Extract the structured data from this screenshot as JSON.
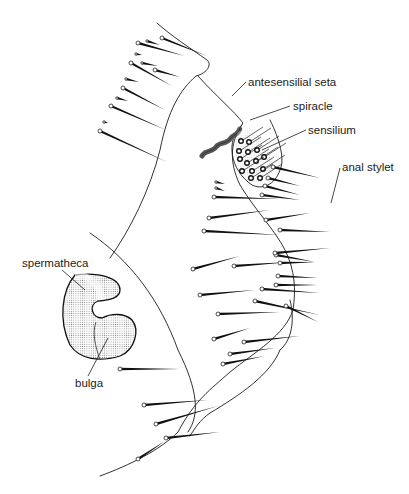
{
  "figure": {
    "labels": {
      "antesensilial_seta": "antesensilial seta",
      "spiracle": "spiracle",
      "sensilium": "sensilium",
      "anal_stylet": "anal stylet",
      "spermatheca": "spermatheca",
      "bulga": "bulga"
    },
    "colors": {
      "ink": "#1a1a1a",
      "stipple": "#bdbdbd",
      "background": "#ffffff"
    },
    "setae": [
      [
        162,
        38,
        207,
        56
      ],
      [
        138,
        43,
        185,
        56
      ],
      [
        147,
        41,
        160,
        45
      ],
      [
        136,
        54,
        142,
        55
      ],
      [
        131,
        63,
        172,
        86
      ],
      [
        142,
        63,
        158,
        66
      ],
      [
        155,
        70,
        180,
        77
      ],
      [
        126,
        79,
        139,
        82
      ],
      [
        123,
        88,
        165,
        110
      ],
      [
        117,
        98,
        128,
        101
      ],
      [
        111,
        106,
        166,
        130
      ],
      [
        104,
        122,
        108,
        123
      ],
      [
        100,
        131,
        167,
        162
      ],
      [
        214,
        197,
        280,
        199
      ],
      [
        209,
        218,
        270,
        210
      ],
      [
        204,
        231,
        280,
        235
      ],
      [
        193,
        269,
        240,
        256
      ],
      [
        234,
        266,
        290,
        262
      ],
      [
        200,
        295,
        255,
        290
      ],
      [
        218,
        314,
        280,
        312
      ],
      [
        214,
        339,
        250,
        328
      ],
      [
        244,
        342,
        300,
        336
      ],
      [
        230,
        354,
        275,
        348
      ],
      [
        223,
        364,
        265,
        356
      ],
      [
        120,
        369,
        180,
        369
      ],
      [
        144,
        405,
        208,
        400
      ],
      [
        156,
        424,
        218,
        406
      ],
      [
        138,
        459,
        165,
        441
      ],
      [
        166,
        438,
        220,
        432
      ],
      [
        255,
        301,
        320,
        315
      ],
      [
        262,
        289,
        320,
        293
      ],
      [
        276,
        285,
        318,
        285
      ],
      [
        278,
        276,
        318,
        278
      ],
      [
        280,
        263,
        315,
        262
      ],
      [
        276,
        255,
        315,
        262
      ],
      [
        286,
        306,
        318,
        322
      ],
      [
        280,
        230,
        330,
        232
      ],
      [
        275,
        253,
        330,
        248
      ],
      [
        266,
        220,
        310,
        213
      ],
      [
        262,
        195,
        300,
        200
      ],
      [
        268,
        178,
        300,
        186
      ],
      [
        273,
        167,
        320,
        178
      ],
      [
        265,
        186,
        300,
        195
      ],
      [
        216,
        182,
        225,
        184
      ],
      [
        216,
        188,
        225,
        191
      ]
    ],
    "sensilium_pores": [
      [
        241,
        141
      ],
      [
        249,
        142
      ],
      [
        239,
        151
      ],
      [
        248,
        152
      ],
      [
        257,
        150
      ],
      [
        240,
        159
      ],
      [
        247,
        163
      ],
      [
        256,
        161
      ],
      [
        264,
        157
      ],
      [
        242,
        171
      ],
      [
        252,
        171
      ],
      [
        263,
        169
      ],
      [
        251,
        178
      ],
      [
        260,
        178
      ]
    ]
  }
}
